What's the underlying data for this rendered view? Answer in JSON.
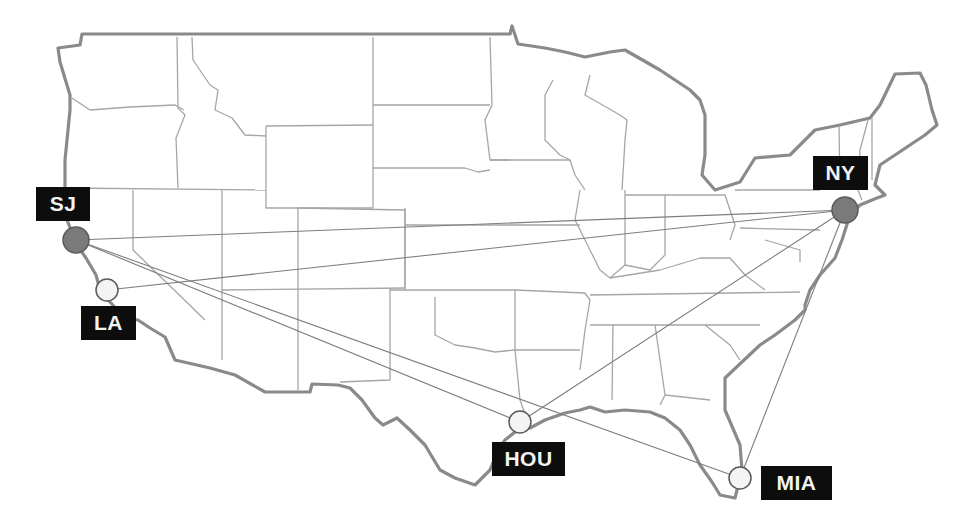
{
  "map": {
    "title": "US city route network",
    "colors": {
      "hub_fill": "#7a7a7a",
      "city_fill": "#f2f2f2",
      "label_bg": "#0d0d0d",
      "label_text": "#f2f2f2",
      "route": "#7d7d7d",
      "outline": "#8a8a8a",
      "state_lines": "#a6a6a6"
    },
    "cities": [
      {
        "code": "SJ",
        "type": "hub",
        "x": 76,
        "y": 240
      },
      {
        "code": "LA",
        "type": "city",
        "x": 107,
        "y": 290
      },
      {
        "code": "NY",
        "type": "hub",
        "x": 845,
        "y": 210
      },
      {
        "code": "HOU",
        "type": "city",
        "x": 520,
        "y": 422
      },
      {
        "code": "MIA",
        "type": "city",
        "x": 740,
        "y": 478
      }
    ],
    "routes": [
      {
        "from": "SJ",
        "to": "NY"
      },
      {
        "from": "LA",
        "to": "NY"
      },
      {
        "from": "SJ",
        "to": "HOU"
      },
      {
        "from": "SJ",
        "to": "MIA"
      },
      {
        "from": "HOU",
        "to": "NY"
      },
      {
        "from": "MIA",
        "to": "NY"
      }
    ],
    "labels": {
      "sj": "SJ",
      "la": "LA",
      "ny": "NY",
      "hou": "HOU",
      "mia": "MIA"
    }
  }
}
